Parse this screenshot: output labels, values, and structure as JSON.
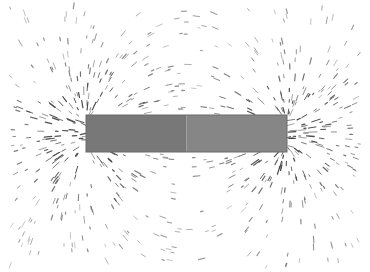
{
  "image": {
    "subject": "Iron filings aligned along the magnetic field of a bar magnet",
    "background": "#ffffff",
    "magnet": {
      "x": 86,
      "y": 115,
      "width": 201,
      "height": 37,
      "north_half_color": "#787878",
      "south_half_color": "#868686",
      "edge_color": "#6a6a6a"
    },
    "filings_color": "#3a3a3a",
    "poles": [
      {
        "name": "left-pole",
        "x": 86,
        "y": 133
      },
      {
        "name": "right-pole",
        "x": 287,
        "y": 133
      }
    ]
  }
}
